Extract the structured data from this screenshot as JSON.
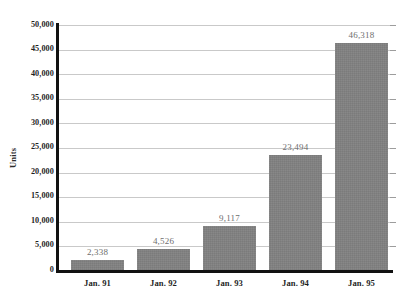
{
  "chart_data": {
    "type": "bar",
    "title": "",
    "subtitle": "",
    "xlabel": "",
    "ylabel": "Units",
    "categories": [
      "Jan. 91",
      "Jan. 92",
      "Jan. 93",
      "Jan. 94",
      "Jan. 95"
    ],
    "values": [
      2338,
      4526,
      9117,
      23494,
      46318
    ],
    "value_labels": [
      "2,338",
      "4,526",
      "9,117",
      "23,494",
      "46,318"
    ],
    "ylim": [
      0,
      50000
    ],
    "ytick_step": 5000,
    "ytick_labels": [
      "50,000",
      "45,000",
      "40,000",
      "35,000",
      "30,000",
      "25,000",
      "20,000",
      "15,000",
      "10,000",
      "5,000",
      "0"
    ],
    "ytick_values": [
      50000,
      45000,
      40000,
      35000,
      30000,
      25000,
      20000,
      15000,
      10000,
      5000,
      0
    ],
    "grid": true,
    "grid_orientation": "horizontal",
    "legend": false,
    "legend_position": "none",
    "bar_color": "#808080",
    "grid_color": "#c9c9c9",
    "axis_color": "#111111",
    "value_label_color": "#6e6e6e",
    "tick_label_color": "#1f1f1f",
    "background_color": "#ffffff"
  }
}
